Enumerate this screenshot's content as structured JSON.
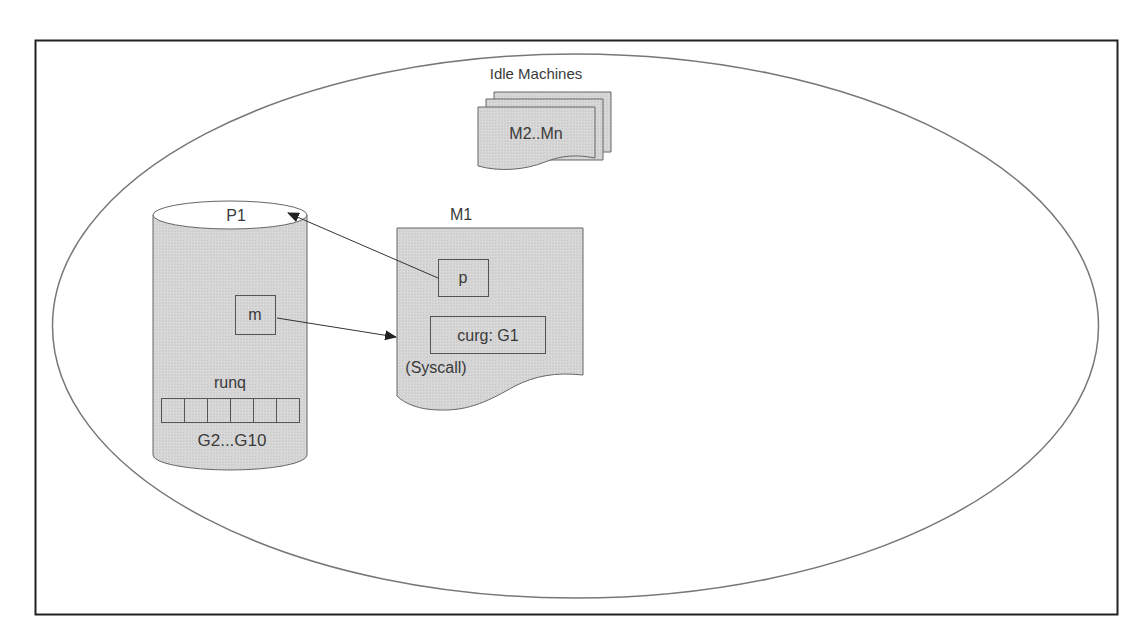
{
  "diagram": {
    "type": "go-scheduler-syscall",
    "idle_machines": {
      "title": "Idle Machines",
      "stack_label": "M2..Mn"
    },
    "processor": {
      "title": "P1",
      "m_field": "m",
      "runq_label": "runq",
      "runq_slots": 6,
      "goroutines_label": "G2...G10"
    },
    "machine": {
      "title": "M1",
      "p_field": "p",
      "curg_field": "curg: G1",
      "state_label": "(Syscall)"
    },
    "edges": [
      {
        "from": "P1.m",
        "to": "M1",
        "label": ""
      },
      {
        "from": "M1.p",
        "to": "P1",
        "label": ""
      }
    ],
    "colors": {
      "shape_fill": "#d4d4d4",
      "stroke": "#555555",
      "frame": "#222222",
      "text": "#3a3a3a"
    }
  }
}
